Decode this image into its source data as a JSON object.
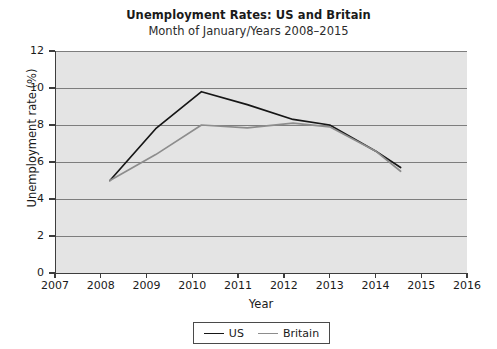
{
  "chart_data": {
    "type": "line",
    "title": "Unemployment Rates: US and Britain",
    "subtitle": "Month of January/Years 2008–2015",
    "xlabel": "Year",
    "ylabel": "Unemployment rate (%)",
    "xlim": [
      2007,
      2016
    ],
    "ylim": [
      0,
      12
    ],
    "xticks": [
      "2007",
      "2008",
      "2009",
      "2010",
      "2011",
      "2012",
      "2013",
      "2014",
      "2015",
      "2016"
    ],
    "yticks": [
      "0",
      "2",
      "4",
      "6",
      "8",
      "10",
      "12"
    ],
    "grid": "horizontal",
    "legend_position": "bottom-center",
    "x": [
      2008.2,
      2009.2,
      2010.2,
      2011.2,
      2012.2,
      2013.0,
      2014.0,
      2014.55
    ],
    "series": [
      {
        "name": "US",
        "color": "#161616",
        "values": [
          5.0,
          7.8,
          9.8,
          9.1,
          8.3,
          8.0,
          6.6,
          5.7
        ]
      },
      {
        "name": "Britain",
        "color": "#8d8d8d",
        "values": [
          5.0,
          6.4,
          8.0,
          7.85,
          8.1,
          7.9,
          6.6,
          5.5
        ]
      }
    ]
  },
  "legend": {
    "items": [
      {
        "label": "US"
      },
      {
        "label": "Britain"
      }
    ]
  },
  "colors": {
    "plot_background": "#e4e4e4",
    "gridline": "#7d7d7d",
    "axis": "#3d3d3d",
    "us_line": "#161616",
    "britain_line": "#8d8d8d"
  }
}
